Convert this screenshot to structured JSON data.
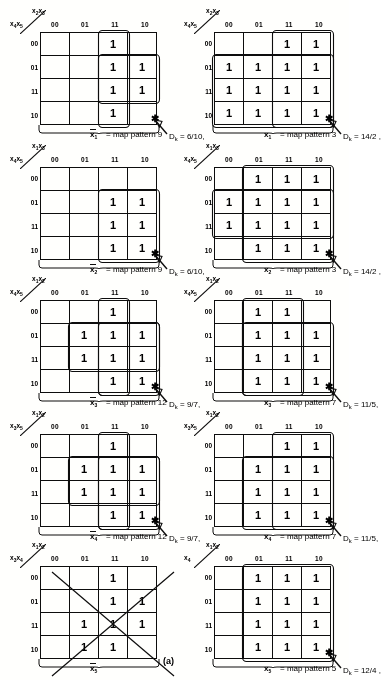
{
  "figure": {
    "caption": "(a)",
    "cell_one": "1",
    "col_headers": [
      "00",
      "01",
      "11",
      "10"
    ],
    "row_headers": [
      "00",
      "01",
      "11",
      "10"
    ]
  },
  "maps": [
    {
      "id": "map-r1c1",
      "top_label": "x2x3",
      "side_label": "x4x5",
      "under_var": "x1",
      "under_var_bar": true,
      "map_pattern_text": "= map pattern  9",
      "dk_line1": "Dk  =  6/10,",
      "cells": [
        [
          "",
          "",
          "1",
          ""
        ],
        [
          "",
          "",
          "1",
          "1"
        ],
        [
          "",
          "",
          "1",
          "1"
        ],
        [
          "",
          "",
          "1",
          ""
        ]
      ],
      "loops": [
        {
          "c": 2,
          "r": 0,
          "w": 1,
          "h": 4
        },
        {
          "c": 2,
          "r": 1,
          "w": 2,
          "h": 2
        }
      ]
    },
    {
      "id": "map-r1c2",
      "top_label": "x2x3",
      "side_label": "x4x5",
      "under_var": "x1",
      "under_var_bar": false,
      "map_pattern_text": "= map pattern  3",
      "dk_line1": "Dk  =  14/2 ,",
      "cells": [
        [
          "",
          "",
          "1",
          "1"
        ],
        [
          "1",
          "1",
          "1",
          "1"
        ],
        [
          "1",
          "1",
          "1",
          "1"
        ],
        [
          "1",
          "1",
          "1",
          "1"
        ]
      ],
      "loops": [
        {
          "c": 2,
          "r": 0,
          "w": 2,
          "h": 4
        },
        {
          "c": 0,
          "r": 1,
          "w": 4,
          "h": 3
        }
      ]
    },
    {
      "id": "map-r2c1",
      "top_label": "x1x3",
      "side_label": "x4x5",
      "under_var": "x2",
      "under_var_bar": true,
      "map_pattern_text": "= map pattern  9",
      "dk_line1": "Dk  =  6/10,",
      "cells": [
        [
          "",
          "",
          "",
          ""
        ],
        [
          "",
          "",
          "1",
          "1"
        ],
        [
          "",
          "",
          "1",
          "1"
        ],
        [
          "",
          "",
          "1",
          "1"
        ]
      ],
      "loops": [
        {
          "c": 2,
          "r": 1,
          "w": 2,
          "h": 3
        }
      ]
    },
    {
      "id": "map-r2c2",
      "top_label": "x1x3",
      "side_label": "x4x5",
      "under_var": "x2",
      "under_var_bar": false,
      "map_pattern_text": "= map pattern  3",
      "dk_line1": "Dk  =  14/2 ,",
      "cells": [
        [
          "",
          "1",
          "1",
          "1"
        ],
        [
          "1",
          "1",
          "1",
          "1"
        ],
        [
          "1",
          "1",
          "1",
          "1"
        ],
        [
          "",
          "1",
          "1",
          "1"
        ]
      ],
      "loops": [
        {
          "c": 1,
          "r": 0,
          "w": 3,
          "h": 4
        },
        {
          "c": 0,
          "r": 1,
          "w": 4,
          "h": 2
        }
      ]
    },
    {
      "id": "map-r3c1",
      "top_label": "x1x2",
      "side_label": "x4x5",
      "under_var": "x3",
      "under_var_bar": true,
      "map_pattern_text": "= map pattern 12",
      "dk_line1": "Dk  =  9/7,",
      "cells": [
        [
          "",
          "",
          "1",
          ""
        ],
        [
          "",
          "1",
          "1",
          "1"
        ],
        [
          "",
          "1",
          "1",
          "1"
        ],
        [
          "",
          "",
          "1",
          "1"
        ]
      ],
      "loops": [
        {
          "c": 2,
          "r": 0,
          "w": 1,
          "h": 4
        },
        {
          "c": 1,
          "r": 1,
          "w": 3,
          "h": 2
        },
        {
          "c": 2,
          "r": 1,
          "w": 2,
          "h": 3
        }
      ]
    },
    {
      "id": "map-r3c2",
      "top_label": "x1x2",
      "side_label": "x4x5",
      "under_var": "x3",
      "under_var_bar": false,
      "map_pattern_text": "= map pattern  7",
      "dk_line1": "Dk  =  11/5,",
      "cells": [
        [
          "",
          "1",
          "1",
          ""
        ],
        [
          "",
          "1",
          "1",
          "1"
        ],
        [
          "",
          "1",
          "1",
          "1"
        ],
        [
          "",
          "1",
          "1",
          "1"
        ]
      ],
      "loops": [
        {
          "c": 1,
          "r": 0,
          "w": 2,
          "h": 4
        },
        {
          "c": 1,
          "r": 1,
          "w": 3,
          "h": 3
        }
      ]
    },
    {
      "id": "map-r4c1",
      "top_label": "x1x2",
      "side_label": "x3x5",
      "under_var": "x4",
      "under_var_bar": true,
      "map_pattern_text": "= map pattern 12",
      "dk_line1": "Dk  =  9/7,",
      "cells": [
        [
          "",
          "",
          "1",
          ""
        ],
        [
          "",
          "1",
          "1",
          "1"
        ],
        [
          "",
          "1",
          "1",
          "1"
        ],
        [
          "",
          "",
          "1",
          "1"
        ]
      ],
      "loops": [
        {
          "c": 2,
          "r": 0,
          "w": 1,
          "h": 4
        },
        {
          "c": 1,
          "r": 1,
          "w": 3,
          "h": 2
        },
        {
          "c": 2,
          "r": 1,
          "w": 2,
          "h": 3
        }
      ]
    },
    {
      "id": "map-r4c2",
      "top_label": "x1x2",
      "side_label": "x3x5",
      "under_var": "x4",
      "under_var_bar": false,
      "map_pattern_text": "= map pattern  7",
      "dk_line1": "Dk  =  11/5,",
      "cells": [
        [
          "",
          "",
          "1",
          "1"
        ],
        [
          "",
          "1",
          "1",
          "1"
        ],
        [
          "",
          "1",
          "1",
          "1"
        ],
        [
          "",
          "1",
          "1",
          "1"
        ]
      ],
      "loops": [
        {
          "c": 2,
          "r": 0,
          "w": 2,
          "h": 4
        },
        {
          "c": 1,
          "r": 1,
          "w": 3,
          "h": 3
        }
      ]
    },
    {
      "id": "map-r5c1",
      "top_label": "x1x2",
      "side_label": "x3x4",
      "under_var": "x5",
      "under_var_bar": true,
      "map_pattern_text": "",
      "dk_line1": "",
      "crossed_out": true,
      "cells": [
        [
          "",
          "",
          "1",
          ""
        ],
        [
          "",
          "",
          "1",
          "1"
        ],
        [
          "",
          "1",
          "1",
          "1"
        ],
        [
          "",
          "1",
          "1",
          ""
        ]
      ],
      "loops": []
    },
    {
      "id": "map-r5c2",
      "top_label": "x1x2",
      "side_label": "x4",
      "under_var": "x5",
      "under_var_bar": false,
      "map_pattern_text": "= map pattern 5",
      "dk_line1": "Dk = 12/4 ,",
      "cells": [
        [
          "",
          "1",
          "1",
          "1"
        ],
        [
          "",
          "1",
          "1",
          "1"
        ],
        [
          "",
          "1",
          "1",
          "1"
        ],
        [
          "",
          "1",
          "1",
          "1"
        ]
      ],
      "loops": [
        {
          "c": 1,
          "r": 0,
          "w": 3,
          "h": 4
        }
      ]
    }
  ]
}
